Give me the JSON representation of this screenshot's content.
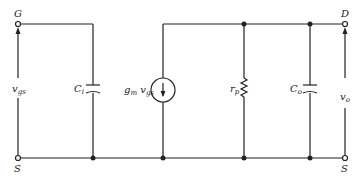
{
  "diagram": {
    "type": "small-signal equivalent circuit",
    "nodes": {
      "gate": {
        "label": "G"
      },
      "drain": {
        "label": "D"
      },
      "source_left": {
        "label": "S"
      },
      "source_right": {
        "label": "S"
      }
    },
    "components": [
      {
        "id": "Ci",
        "kind": "capacitor",
        "label": "C",
        "sub": "i"
      },
      {
        "id": "gm",
        "kind": "current-source",
        "label": "g",
        "sub": "m",
        "label2": "v",
        "sub2": "gs"
      },
      {
        "id": "rp",
        "kind": "resistor",
        "label": "r",
        "sub": "p"
      },
      {
        "id": "Co",
        "kind": "capacitor",
        "label": "C",
        "sub": "o"
      }
    ],
    "voltages": {
      "input": {
        "label": "v",
        "sub": "gs"
      },
      "output": {
        "label": "v",
        "sub": "o"
      }
    },
    "colors": {
      "line": "#222222",
      "background": "#ffffff"
    }
  }
}
